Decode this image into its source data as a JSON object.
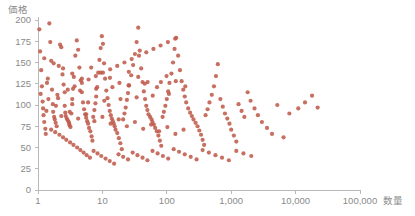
{
  "chart_data": {
    "type": "scatter",
    "title": "",
    "xlabel": "数量",
    "ylabel": "価格",
    "xscale": "log",
    "yscale": "linear",
    "xlim": [
      1,
      100000
    ],
    "ylim": [
      0,
      200
    ],
    "grid": false,
    "legend": null,
    "marker_color": "#bf5b4b",
    "marker_size": 2.1,
    "marker_opacity": 0.88,
    "xticks": [
      1,
      10,
      100,
      1000,
      10000,
      100000
    ],
    "xtick_labels": [
      "1",
      "10",
      "100",
      "1,000",
      "10,000",
      "100,000"
    ],
    "yticks": [
      0,
      25,
      50,
      75,
      100,
      125,
      150,
      175,
      200
    ],
    "ytick_labels": [
      "0",
      "25",
      "50",
      "75",
      "100",
      "125",
      "150",
      "175",
      "200"
    ],
    "series": [
      {
        "name": "",
        "color": "#bf5b4b",
        "points": [
          [
            1.05,
            189
          ],
          [
            1.08,
            163
          ],
          [
            1.12,
            141
          ],
          [
            1.15,
            122
          ],
          [
            1.18,
            104
          ],
          [
            1.2,
            96
          ],
          [
            1.22,
            88
          ],
          [
            1.25,
            80
          ],
          [
            1.3,
            72
          ],
          [
            1.32,
            66
          ],
          [
            1.38,
            126
          ],
          [
            1.42,
            131
          ],
          [
            1.5,
            196
          ],
          [
            1.55,
            174
          ],
          [
            1.6,
            152
          ],
          [
            1.65,
            118
          ],
          [
            1.7,
            101
          ],
          [
            1.72,
            92
          ],
          [
            1.78,
            86
          ],
          [
            1.82,
            83
          ],
          [
            1.88,
            79
          ],
          [
            1.95,
            75
          ],
          [
            2.0,
            112
          ],
          [
            2.05,
            108
          ],
          [
            2.1,
            146
          ],
          [
            2.2,
            171
          ],
          [
            2.3,
            168
          ],
          [
            2.4,
            136
          ],
          [
            2.5,
            124
          ],
          [
            2.6,
            99
          ],
          [
            2.65,
            91
          ],
          [
            2.7,
            87
          ],
          [
            2.8,
            84
          ],
          [
            2.9,
            82
          ],
          [
            3.0,
            80
          ],
          [
            3.05,
            78
          ],
          [
            3.1,
            76
          ],
          [
            3.2,
            74
          ],
          [
            3.3,
            90
          ],
          [
            3.4,
            107
          ],
          [
            3.5,
            119
          ],
          [
            3.6,
            133
          ],
          [
            3.8,
            158
          ],
          [
            4.0,
            176
          ],
          [
            4.2,
            165
          ],
          [
            4.4,
            144
          ],
          [
            4.6,
            129
          ],
          [
            4.8,
            115
          ],
          [
            5.0,
            103
          ],
          [
            5.2,
            95
          ],
          [
            5.4,
            89
          ],
          [
            5.6,
            85
          ],
          [
            5.8,
            81
          ],
          [
            6.0,
            78
          ],
          [
            6.2,
            73
          ],
          [
            6.5,
            69
          ],
          [
            6.8,
            63
          ],
          [
            7.0,
            58
          ],
          [
            7.2,
            86
          ],
          [
            7.5,
            94
          ],
          [
            7.8,
            102
          ],
          [
            8.0,
            110
          ],
          [
            8.3,
            121
          ],
          [
            8.6,
            138
          ],
          [
            9.0,
            153
          ],
          [
            9.4,
            167
          ],
          [
            9.8,
            181
          ],
          [
            10.2,
            172
          ],
          [
            10.6,
            149
          ],
          [
            11.0,
            131
          ],
          [
            11.5,
            117
          ],
          [
            12.0,
            108
          ],
          [
            12.5,
            100
          ],
          [
            13.0,
            93
          ],
          [
            13.5,
            88
          ],
          [
            14.0,
            84
          ],
          [
            14.5,
            81
          ],
          [
            15.0,
            78
          ],
          [
            15.5,
            75
          ],
          [
            16.0,
            71
          ],
          [
            17.0,
            67
          ],
          [
            18.0,
            61
          ],
          [
            19.0,
            55
          ],
          [
            20.0,
            48
          ],
          [
            21.0,
            83
          ],
          [
            22.0,
            90
          ],
          [
            23.0,
            97
          ],
          [
            24.0,
            106
          ],
          [
            25.0,
            114
          ],
          [
            26.0,
            123
          ],
          [
            28.0,
            135
          ],
          [
            30.0,
            147
          ],
          [
            32.0,
            160
          ],
          [
            34.0,
            174
          ],
          [
            36.0,
            191
          ],
          [
            38.0,
            164
          ],
          [
            40.0,
            143
          ],
          [
            42.0,
            127
          ],
          [
            44.0,
            116
          ],
          [
            46.0,
            107
          ],
          [
            48.0,
            99
          ],
          [
            50.0,
            94
          ],
          [
            52.0,
            89
          ],
          [
            55.0,
            86
          ],
          [
            58.0,
            83
          ],
          [
            60.0,
            80
          ],
          [
            63.0,
            77
          ],
          [
            66.0,
            73
          ],
          [
            70.0,
            69
          ],
          [
            74.0,
            64
          ],
          [
            78.0,
            58
          ],
          [
            82.0,
            52
          ],
          [
            86.0,
            86
          ],
          [
            90.0,
            92
          ],
          [
            95.0,
            99
          ],
          [
            100.0,
            107
          ],
          [
            105.0,
            116
          ],
          [
            110.0,
            126
          ],
          [
            118.0,
            137
          ],
          [
            125.0,
            150
          ],
          [
            132.0,
            166
          ],
          [
            140.0,
            179
          ],
          [
            150.0,
            158
          ],
          [
            160.0,
            141
          ],
          [
            170.0,
            128
          ],
          [
            180.0,
            118
          ],
          [
            190.0,
            110
          ],
          [
            200.0,
            103
          ],
          [
            215.0,
            96
          ],
          [
            230.0,
            91
          ],
          [
            245.0,
            87
          ],
          [
            260.0,
            83
          ],
          [
            280.0,
            79
          ],
          [
            300.0,
            75
          ],
          [
            320.0,
            70
          ],
          [
            340.0,
            65
          ],
          [
            360.0,
            59
          ],
          [
            380.0,
            53
          ],
          [
            400.0,
            88
          ],
          [
            430.0,
            95
          ],
          [
            460.0,
            103
          ],
          [
            500.0,
            112
          ],
          [
            540.0,
            122
          ],
          [
            580.0,
            134
          ],
          [
            620.0,
            148
          ],
          [
            680.0,
            107
          ],
          [
            740.0,
            98
          ],
          [
            800.0,
            90
          ],
          [
            870.0,
            84
          ],
          [
            940.0,
            78
          ],
          [
            1000.0,
            71
          ],
          [
            1100.0,
            64
          ],
          [
            1200.0,
            57
          ],
          [
            1300.0,
            101
          ],
          [
            1450.0,
            93
          ],
          [
            1600.0,
            86
          ],
          [
            1800.0,
            115
          ],
          [
            2000.0,
            105
          ],
          [
            2300.0,
            96
          ],
          [
            2600.0,
            88
          ],
          [
            3000.0,
            80
          ],
          [
            3600.0,
            73
          ],
          [
            4300.0,
            66
          ],
          [
            5200.0,
            100
          ],
          [
            6500.0,
            62
          ],
          [
            8000.0,
            90
          ],
          [
            11000.0,
            96
          ],
          [
            14000.0,
            103
          ],
          [
            18000.0,
            111
          ],
          [
            22000.0,
            97
          ],
          [
            1.1,
            113
          ],
          [
            1.35,
            93
          ],
          [
            1.6,
            71
          ],
          [
            1.85,
            68
          ],
          [
            2.15,
            65
          ],
          [
            2.45,
            62
          ],
          [
            2.75,
            59
          ],
          [
            3.15,
            56
          ],
          [
            3.55,
            53
          ],
          [
            4.05,
            50
          ],
          [
            4.55,
            47
          ],
          [
            5.1,
            44
          ],
          [
            5.7,
            41
          ],
          [
            6.4,
            38
          ],
          [
            7.3,
            46
          ],
          [
            8.4,
            43
          ],
          [
            9.6,
            40
          ],
          [
            11.2,
            37
          ],
          [
            13.0,
            34
          ],
          [
            15.2,
            31
          ],
          [
            17.8,
            42
          ],
          [
            21.0,
            39
          ],
          [
            25.0,
            36
          ],
          [
            29.5,
            44
          ],
          [
            35.0,
            41
          ],
          [
            42.0,
            38
          ],
          [
            50.0,
            35
          ],
          [
            60.0,
            46
          ],
          [
            72.0,
            43
          ],
          [
            87.0,
            40
          ],
          [
            105.0,
            37
          ],
          [
            128.0,
            48
          ],
          [
            155.0,
            45
          ],
          [
            190.0,
            42
          ],
          [
            235.0,
            39
          ],
          [
            290.0,
            36
          ],
          [
            360.0,
            47
          ],
          [
            450.0,
            44
          ],
          [
            570.0,
            41
          ],
          [
            720.0,
            38
          ],
          [
            920.0,
            35
          ],
          [
            1200.0,
            46
          ],
          [
            1550.0,
            43
          ],
          [
            2050.0,
            40
          ],
          [
            2.9,
            118
          ],
          [
            3.7,
            122
          ],
          [
            4.8,
            126
          ],
          [
            6.1,
            130
          ],
          [
            7.9,
            134
          ],
          [
            10.2,
            138
          ],
          [
            13.2,
            142
          ],
          [
            17.0,
            146
          ],
          [
            22.0,
            150
          ],
          [
            28.5,
            154
          ],
          [
            37.0,
            158
          ],
          [
            48.0,
            162
          ],
          [
            62.0,
            166
          ],
          [
            80.0,
            170
          ],
          [
            104.0,
            174
          ],
          [
            135.0,
            178
          ],
          [
            2.3,
            87
          ],
          [
            3.1,
            92
          ],
          [
            4.2,
            84
          ],
          [
            5.6,
            89
          ],
          [
            7.5,
            81
          ],
          [
            10.0,
            86
          ],
          [
            13.4,
            78
          ],
          [
            17.9,
            83
          ],
          [
            24.0,
            75
          ],
          [
            32.0,
            80
          ],
          [
            43.0,
            72
          ],
          [
            57.0,
            77
          ],
          [
            76.0,
            69
          ],
          [
            102.0,
            74
          ],
          [
            136.0,
            66
          ],
          [
            182.0,
            71
          ],
          [
            1.45,
            107
          ],
          [
            1.9,
            99
          ],
          [
            2.6,
            115
          ],
          [
            3.4,
            101
          ],
          [
            4.5,
            117
          ],
          [
            6.0,
            103
          ],
          [
            8.0,
            119
          ],
          [
            10.7,
            105
          ],
          [
            14.3,
            121
          ],
          [
            19.1,
            107
          ],
          [
            25.5,
            123
          ],
          [
            34.0,
            109
          ],
          [
            45.5,
            125
          ],
          [
            60.5,
            111
          ],
          [
            81.0,
            127
          ],
          [
            108.0,
            113
          ],
          [
            1.25,
            155
          ],
          [
            1.75,
            149
          ],
          [
            2.45,
            143
          ],
          [
            3.4,
            137
          ],
          [
            4.8,
            131
          ],
          [
            6.7,
            144
          ],
          [
            9.4,
            138
          ],
          [
            13.1,
            132
          ],
          [
            18.4,
            126
          ],
          [
            25.7,
            139
          ],
          [
            36.0,
            133
          ],
          [
            50.4,
            127
          ],
          [
            70.5,
            121
          ],
          [
            99.0,
            134
          ],
          [
            138.0,
            128
          ],
          [
            194.0,
            122
          ]
        ]
      }
    ]
  },
  "axes": {
    "y_title": "価格",
    "x_title": "数量"
  }
}
